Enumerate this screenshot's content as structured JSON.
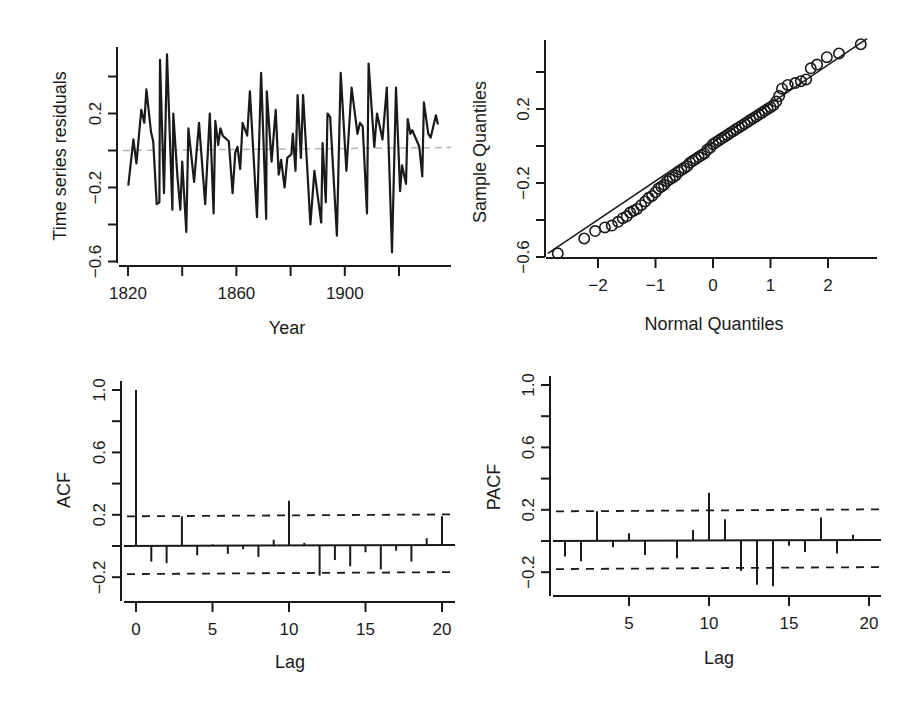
{
  "chart_data": [
    {
      "id": "ts",
      "type": "line",
      "title": "",
      "xlabel": "Year",
      "ylabel": "Time series residuals",
      "xlim": [
        1810,
        1940
      ],
      "ylim": [
        -0.62,
        0.57
      ],
      "xticks": [
        1820,
        1840,
        1860,
        1880,
        1900,
        1920
      ],
      "xtick_labels": [
        "1820",
        "",
        "1860",
        "",
        "1900",
        ""
      ],
      "yticks": [
        -0.6,
        -0.4,
        -0.2,
        0.0,
        0.2,
        0.4
      ],
      "ytick_labels": [
        "−0.6",
        "",
        "−0.2",
        "",
        "0.2",
        ""
      ],
      "reference_line": {
        "y": 0.0,
        "style": "dashed",
        "color": "#b5b5b5"
      },
      "grid": false,
      "x": [
        1820.1,
        1822.0,
        1823.1,
        1824.9,
        1826.0,
        1826.8,
        1828.5,
        1829.3,
        1830.6,
        1831.6,
        1831.8,
        1833.3,
        1834.4,
        1836.4,
        1836.7,
        1838.2,
        1839.3,
        1840.0,
        1841.5,
        1842.3,
        1844.4,
        1846.2,
        1848.5,
        1850.2,
        1851.6,
        1852.2,
        1853.3,
        1854.1,
        1855.0,
        1857.2,
        1858.6,
        1859.6,
        1860.4,
        1861.4,
        1862.3,
        1864.0,
        1865.0,
        1867.6,
        1869.1,
        1871.0,
        1871.2,
        1873.0,
        1874.5,
        1875.6,
        1876.5,
        1877.8,
        1878.8,
        1880.3,
        1880.8,
        1881.8,
        1882.6,
        1883.8,
        1884.6,
        1887.3,
        1888.8,
        1891.3,
        1891.8,
        1893.0,
        1893.6,
        1894.6,
        1897.1,
        1898.5,
        1900.6,
        1902.5,
        1904.7,
        1905.6,
        1906.6,
        1908.2,
        1908.8,
        1910.9,
        1911.9,
        1913.9,
        1915.5,
        1917.4,
        1918.9,
        1920.4,
        1921.1,
        1922.6,
        1923.2,
        1924.2,
        1924.9,
        1927.5,
        1928.6,
        1929.2,
        1930.8,
        1931.7,
        1933.6,
        1934.4
      ],
      "values": [
        -0.19,
        0.06,
        -0.07,
        0.22,
        0.15,
        0.33,
        0.1,
        0.05,
        -0.29,
        -0.28,
        0.49,
        -0.23,
        0.52,
        -0.32,
        0.2,
        -0.13,
        -0.32,
        -0.06,
        -0.44,
        0.12,
        -0.17,
        0.15,
        -0.29,
        0.2,
        -0.34,
        0.16,
        0.03,
        0.12,
        0.08,
        0.05,
        -0.23,
        -0.01,
        0.02,
        -0.1,
        0.15,
        0.08,
        0.32,
        -0.36,
        0.42,
        -0.37,
        0.32,
        -0.06,
        0.22,
        -0.13,
        -0.05,
        -0.2,
        -0.04,
        -0.02,
        0.09,
        -0.11,
        0.3,
        -0.04,
        0.3,
        -0.4,
        -0.11,
        -0.39,
        0.04,
        -0.28,
        0.2,
        0.18,
        -0.46,
        0.42,
        -0.11,
        0.34,
        0.09,
        0.15,
        0.13,
        -0.34,
        0.47,
        0.02,
        0.2,
        0.06,
        0.34,
        -0.55,
        0.34,
        -0.22,
        -0.08,
        -0.18,
        0.17,
        0.09,
        0.11,
        0.02,
        -0.14,
        0.26,
        0.09,
        0.07,
        0.19,
        0.14
      ]
    },
    {
      "id": "qq",
      "type": "scatter",
      "title": "",
      "xlabel": "Normal Quantiles",
      "ylabel": "Sample Quantiles",
      "xlim": [
        -2.9,
        2.9
      ],
      "ylim": [
        -0.62,
        0.58
      ],
      "xticks": [
        -2,
        -1,
        0,
        1,
        2
      ],
      "xtick_labels": [
        "−2",
        "−1",
        "0",
        "1",
        "2"
      ],
      "yticks": [
        -0.6,
        -0.4,
        -0.2,
        0.0,
        0.2,
        0.4
      ],
      "ytick_labels": [
        "−0.6",
        "",
        "−0.2",
        "",
        "0.2",
        ""
      ],
      "reference_line": {
        "from": [
          -2.87,
          -0.58
        ],
        "to": [
          2.68,
          0.58
        ],
        "style": "solid"
      },
      "marker": "open-circle",
      "grid": false,
      "points": [
        [
          -2.7,
          -0.58
        ],
        [
          -2.24,
          -0.5
        ],
        [
          -2.05,
          -0.46
        ],
        [
          -1.88,
          -0.44
        ],
        [
          -1.76,
          -0.43
        ],
        [
          -1.65,
          -0.41
        ],
        [
          -1.57,
          -0.39
        ],
        [
          -1.5,
          -0.38
        ],
        [
          -1.44,
          -0.36
        ],
        [
          -1.38,
          -0.35
        ],
        [
          -1.32,
          -0.34
        ],
        [
          -1.25,
          -0.32
        ],
        [
          -1.18,
          -0.3
        ],
        [
          -1.12,
          -0.28
        ],
        [
          -1.06,
          -0.27
        ],
        [
          -1.0,
          -0.25
        ],
        [
          -0.95,
          -0.23
        ],
        [
          -0.9,
          -0.22
        ],
        [
          -0.85,
          -0.21
        ],
        [
          -0.8,
          -0.19
        ],
        [
          -0.75,
          -0.18
        ],
        [
          -0.7,
          -0.17
        ],
        [
          -0.65,
          -0.16
        ],
        [
          -0.6,
          -0.14
        ],
        [
          -0.55,
          -0.13
        ],
        [
          -0.5,
          -0.12
        ],
        [
          -0.45,
          -0.11
        ],
        [
          -0.4,
          -0.09
        ],
        [
          -0.35,
          -0.08
        ],
        [
          -0.3,
          -0.07
        ],
        [
          -0.25,
          -0.06
        ],
        [
          -0.2,
          -0.05
        ],
        [
          -0.15,
          -0.04
        ],
        [
          -0.1,
          -0.02
        ],
        [
          -0.05,
          -0.01
        ],
        [
          0.0,
          0.01
        ],
        [
          0.05,
          0.02
        ],
        [
          0.1,
          0.03
        ],
        [
          0.15,
          0.04
        ],
        [
          0.2,
          0.05
        ],
        [
          0.25,
          0.06
        ],
        [
          0.3,
          0.07
        ],
        [
          0.35,
          0.08
        ],
        [
          0.4,
          0.09
        ],
        [
          0.45,
          0.1
        ],
        [
          0.5,
          0.11
        ],
        [
          0.55,
          0.12
        ],
        [
          0.6,
          0.13
        ],
        [
          0.65,
          0.14
        ],
        [
          0.7,
          0.15
        ],
        [
          0.75,
          0.16
        ],
        [
          0.8,
          0.17
        ],
        [
          0.85,
          0.18
        ],
        [
          0.9,
          0.19
        ],
        [
          0.95,
          0.2
        ],
        [
          1.0,
          0.21
        ],
        [
          1.05,
          0.22
        ],
        [
          1.1,
          0.24
        ],
        [
          1.15,
          0.27
        ],
        [
          1.2,
          0.31
        ],
        [
          1.3,
          0.33
        ],
        [
          1.43,
          0.34
        ],
        [
          1.53,
          0.35
        ],
        [
          1.62,
          0.36
        ],
        [
          1.7,
          0.42
        ],
        [
          1.81,
          0.44
        ],
        [
          1.98,
          0.48
        ],
        [
          2.19,
          0.5
        ],
        [
          2.57,
          0.55
        ]
      ]
    },
    {
      "id": "acf",
      "type": "bar",
      "title": "",
      "xlabel": "Lag",
      "ylabel": "ACF",
      "xlim": [
        -0.8,
        20.8
      ],
      "ylim": [
        -0.36,
        1.07
      ],
      "xticks": [
        0,
        5,
        10,
        15,
        20
      ],
      "xtick_labels": [
        "0",
        "5",
        "10",
        "15",
        "20"
      ],
      "yticks": [
        -0.2,
        0.0,
        0.2,
        0.4,
        0.6,
        0.8,
        1.0
      ],
      "ytick_labels": [
        "−0.2",
        "",
        "0.2",
        "",
        "0.6",
        "",
        "1.0"
      ],
      "confidence_bounds": [
        0.19,
        -0.18
      ],
      "grid": false,
      "categories": [
        0,
        1,
        2,
        3,
        4,
        5,
        6,
        7,
        8,
        9,
        10,
        11,
        12,
        13,
        14,
        15,
        16,
        17,
        18,
        19,
        20
      ],
      "values": [
        1.0,
        -0.1,
        -0.11,
        0.19,
        -0.06,
        0.01,
        -0.05,
        -0.02,
        -0.07,
        0.04,
        0.29,
        0.02,
        -0.19,
        -0.09,
        -0.13,
        -0.04,
        -0.15,
        -0.03,
        -0.1,
        0.05,
        0.19
      ]
    },
    {
      "id": "pacf",
      "type": "bar",
      "title": "",
      "xlabel": "Lag",
      "ylabel": "PACF",
      "xlim": [
        0.3,
        20.8
      ],
      "ylim": [
        -0.36,
        1.07
      ],
      "xticks": [
        5,
        10,
        15,
        20
      ],
      "xtick_labels": [
        "5",
        "10",
        "15",
        "20"
      ],
      "yticks": [
        -0.2,
        0.0,
        0.2,
        0.4,
        0.6,
        0.8,
        1.0
      ],
      "ytick_labels": [
        "−0.2",
        "",
        "0.2",
        "",
        "0.6",
        "",
        "1.0"
      ],
      "confidence_bounds": [
        0.19,
        -0.18
      ],
      "grid": false,
      "categories": [
        1,
        2,
        3,
        4,
        5,
        6,
        7,
        8,
        9,
        10,
        11,
        12,
        13,
        14,
        15,
        16,
        17,
        18,
        19,
        20
      ],
      "values": [
        -0.1,
        -0.13,
        0.19,
        -0.04,
        0.05,
        -0.09,
        0.0,
        -0.11,
        0.07,
        0.31,
        0.14,
        -0.19,
        -0.28,
        -0.29,
        -0.03,
        -0.07,
        0.15,
        -0.08,
        0.04,
        0.01
      ]
    }
  ],
  "layout": {
    "ts": {
      "left": 128,
      "right": 451,
      "top": 47,
      "bottom": 265,
      "x0": 1820,
      "x1": 1920,
      "px0": 128,
      "px1": 399,
      "yv0": 0.0,
      "ypx0": 150.5,
      "yv1": 0.2,
      "ypx1": 113.5,
      "yaxis_x": 117,
      "xaxis_y": 266,
      "yaxis_top": 47,
      "yaxis_bottom": 263,
      "xaxis_left": 119,
      "xaxis_right": 451
    },
    "qq": {
      "x0": 0,
      "px0": 713,
      "x1": 1,
      "px1": 770.5,
      "yv0": 0.0,
      "ypx0": 146,
      "yv1": 0.2,
      "ypx1": 109,
      "yaxis_x": 545,
      "xaxis_y": 258,
      "yaxis_top": 40,
      "yaxis_bottom": 257,
      "xaxis_left": 546,
      "xaxis_right": 877
    },
    "acf": {
      "x0": 0,
      "px0": 136,
      "x1": 20,
      "px1": 442,
      "yv0": 0.0,
      "ypx0": 546,
      "yv1": 1.0,
      "ypx1": 390,
      "yaxis_x": 121,
      "xaxis_y": 602,
      "yaxis_top": 381,
      "yaxis_bottom": 601,
      "xaxis_left": 124,
      "xaxis_right": 455
    },
    "pacf": {
      "x0": 5,
      "px0": 629,
      "x1": 20,
      "px1": 869,
      "yv0": 0.0,
      "ypx0": 541,
      "yv1": 1.0,
      "ypx1": 385,
      "yaxis_x": 550,
      "xaxis_y": 596,
      "yaxis_top": 376,
      "yaxis_bottom": 596,
      "xaxis_left": 553,
      "xaxis_right": 881
    }
  }
}
